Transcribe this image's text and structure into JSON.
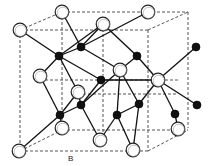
{
  "diagram": {
    "label_B": "B",
    "colors": {
      "bond": "#111111",
      "cell_edge": "#444444",
      "atom_open_fill": "#ffffff",
      "atom_filled": "#111111"
    },
    "cell_edges": [
      [
        20,
        30,
        148,
        30
      ],
      [
        62,
        12,
        188,
        12
      ],
      [
        20,
        30,
        62,
        12
      ],
      [
        148,
        30,
        188,
        12
      ],
      [
        20,
        30,
        20,
        151
      ],
      [
        62,
        12,
        62,
        130
      ],
      [
        188,
        12,
        188,
        128
      ],
      [
        148,
        30,
        148,
        151
      ],
      [
        20,
        151,
        148,
        151
      ],
      [
        62,
        130,
        188,
        130
      ],
      [
        20,
        151,
        62,
        130
      ],
      [
        148,
        151,
        188,
        130
      ],
      [
        103,
        24,
        103,
        139
      ],
      [
        40,
        80,
        178,
        80
      ],
      [
        78,
        94,
        178,
        94
      ]
    ],
    "open_atoms": [
      {
        "x": 20,
        "y": 30
      },
      {
        "x": 62,
        "y": 12
      },
      {
        "x": 103,
        "y": 24
      },
      {
        "x": 148,
        "y": 12
      },
      {
        "x": 40,
        "y": 76
      },
      {
        "x": 120,
        "y": 70
      },
      {
        "x": 158,
        "y": 80
      },
      {
        "x": 78,
        "y": 92
      },
      {
        "x": 62,
        "y": 128
      },
      {
        "x": 100,
        "y": 140
      },
      {
        "x": 19,
        "y": 151
      },
      {
        "x": 133,
        "y": 150
      },
      {
        "x": 178,
        "y": 129
      }
    ],
    "filled_atoms": [
      {
        "x": 59,
        "y": 56
      },
      {
        "x": 81,
        "y": 47
      },
      {
        "x": 137,
        "y": 56
      },
      {
        "x": 196,
        "y": 47
      },
      {
        "x": 60,
        "y": 115
      },
      {
        "x": 81,
        "y": 105
      },
      {
        "x": 117,
        "y": 115
      },
      {
        "x": 139,
        "y": 104
      },
      {
        "x": 175,
        "y": 114
      },
      {
        "x": 197,
        "y": 105
      },
      {
        "x": 101,
        "y": 80
      }
    ],
    "bonds": [
      [
        20,
        30,
        59,
        56
      ],
      [
        62,
        12,
        81,
        47
      ],
      [
        103,
        24,
        81,
        47
      ],
      [
        148,
        12,
        81,
        47
      ],
      [
        103,
        24,
        137,
        56
      ],
      [
        59,
        56,
        40,
        76
      ],
      [
        59,
        56,
        78,
        92
      ],
      [
        59,
        56,
        103,
        24
      ],
      [
        81,
        47,
        120,
        70
      ],
      [
        137,
        56,
        158,
        80
      ],
      [
        137,
        56,
        120,
        70
      ],
      [
        196,
        47,
        158,
        80
      ],
      [
        81,
        47,
        59,
        56
      ],
      [
        40,
        76,
        60,
        115
      ],
      [
        78,
        92,
        60,
        115
      ],
      [
        78,
        92,
        81,
        105
      ],
      [
        120,
        70,
        81,
        105
      ],
      [
        120,
        70,
        139,
        104
      ],
      [
        158,
        80,
        139,
        104
      ],
      [
        158,
        80,
        175,
        114
      ],
      [
        158,
        80,
        197,
        105
      ],
      [
        120,
        70,
        117,
        115
      ],
      [
        60,
        115,
        19,
        151
      ],
      [
        60,
        115,
        62,
        128
      ],
      [
        81,
        105,
        100,
        140
      ],
      [
        81,
        105,
        60,
        115
      ],
      [
        117,
        115,
        100,
        140
      ],
      [
        117,
        115,
        133,
        150
      ],
      [
        139,
        104,
        133,
        150
      ],
      [
        175,
        114,
        178,
        129
      ],
      [
        139,
        104,
        117,
        115
      ],
      [
        59,
        56,
        101,
        80
      ],
      [
        101,
        80,
        158,
        80
      ],
      [
        101,
        80,
        81,
        105
      ]
    ]
  }
}
